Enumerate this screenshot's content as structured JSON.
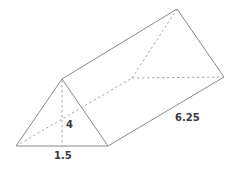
{
  "diagram": {
    "type": "triangular-prism",
    "labels": {
      "height": "4",
      "base_half": "1.5",
      "length": "6.25"
    },
    "colors": {
      "edge": "#8a8a8a",
      "hidden_edge": "#a8a8a8",
      "label": "#3a3a3a",
      "background": "#ffffff"
    }
  }
}
